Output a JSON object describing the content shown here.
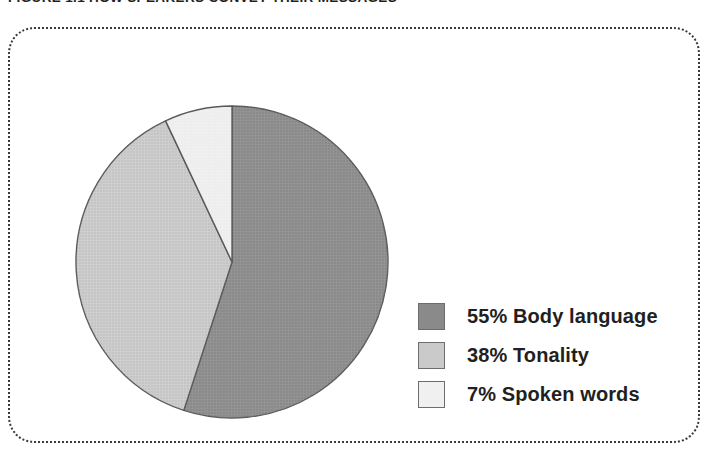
{
  "figure": {
    "caption": "FIGURE 1.1  HOW SPEAKERS CONVEY THEIR MESSAGES"
  },
  "chart_data": {
    "type": "pie",
    "title": "FIGURE 1.1  HOW SPEAKERS CONVEY THEIR MESSAGES",
    "xlabel": "",
    "ylabel": "",
    "legend_position": "right",
    "grid": false,
    "start_angle_deg": 0,
    "direction": "clockwise",
    "categories": [
      "Body language",
      "Tonality",
      "Spoken words"
    ],
    "values": [
      55,
      38,
      7
    ],
    "unit": "%",
    "colors": [
      "#8a8a8a",
      "#cacaca",
      "#f0f0f0"
    ],
    "slice_outline": "#595959",
    "slices": [
      {
        "label": "Body language",
        "value": 55,
        "display": "55% Body language",
        "color": "#8a8a8a"
      },
      {
        "label": "Tonality",
        "value": 38,
        "display": "38% Tonality",
        "color": "#cacaca"
      },
      {
        "label": "Spoken words",
        "value": 7,
        "display": "7% Spoken words",
        "color": "#f0f0f0"
      }
    ],
    "legend": [
      {
        "swatch_color": "#8a8a8a",
        "text": "55% Body language"
      },
      {
        "swatch_color": "#cacaca",
        "text": "38% Tonality"
      },
      {
        "swatch_color": "#f0f0f0",
        "text": "7% Spoken words"
      }
    ]
  }
}
